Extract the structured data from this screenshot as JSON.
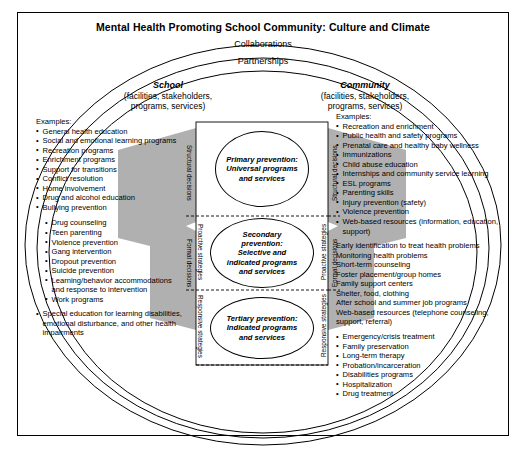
{
  "title": "Mental Health Promoting School Community: Culture and Climate",
  "outer_ring_label": "Collaborations",
  "inner_ring_label": "Partnerships",
  "columns": {
    "school": {
      "name": "School",
      "subtitle": "(facilities, stakeholders,\nprograms, services)",
      "examples_label": "Examples:",
      "primary_items": [
        "General health education",
        "Social and emotional learning programs",
        "Recreation programs",
        "Enrichment programs",
        "Support for transitions",
        "Conflict resolution",
        "Home involvement",
        "Drug and alcohol education",
        "Bullying prevention"
      ],
      "secondary_items": [
        "Drug counseling",
        "Teen parenting",
        "Violence prevention",
        "Gang intervention",
        "Dropout prevention",
        "Suicide prevention",
        "Learning/behavior accommodations and response to intervention",
        "Work programs"
      ],
      "tertiary_items": [
        "Special education for learning disabilities, emotional disturbance, and other health impairments"
      ]
    },
    "community": {
      "name": "Community",
      "subtitle": "(facilities, stakeholders,\nprograms, services)",
      "examples_label": "Examples:",
      "primary_items": [
        "Recreation and enrichment",
        "Public health and safety programs",
        "Prenatal care and healthy baby wellness",
        "Immunizations",
        "Child abuse education",
        "Internships and community service learning",
        "ESL programs",
        "Parenting skills",
        "Injury prevention (safety)",
        "Violence prevention",
        "Web-based resources (information, education, support)"
      ],
      "secondary_items": [
        "Early identification to treat health problems",
        "Monitoring health problems",
        "Short-term counseling",
        "Foster placement/group homes",
        "Family support centers",
        "Shelter, food, clothing",
        "After school and summer job programs",
        "Web-based resources (telephone counseling, support, referral)"
      ],
      "tertiary_items": [
        "Emergency/crisis treatment",
        "Family preservation",
        "Long-term therapy",
        "Probation/incarceration",
        "Disabilities programs",
        "Hospitalization",
        "Drug treatment"
      ]
    }
  },
  "center": {
    "levels": [
      {
        "text": "Primary prevention:\nUniversal programs\nand services"
      },
      {
        "text": "Secondary\nprevention:\nSelective and\nindicated programs\nand services"
      },
      {
        "text": "Tertiary prevention:\nIndicated programs\nand services"
      }
    ]
  },
  "vertical_labels": {
    "outer_left_top": "Structural decisions",
    "outer_left_mid": "Formal decisions",
    "outer_right_top": "Structural decisions",
    "outer_right_mid": "Formal decisions",
    "inner_left_top": "Proactive strategies",
    "inner_left_bottom": "Responsive strategies",
    "inner_right_top": "Proactive strategies",
    "inner_right_bottom": "Responsive strategies"
  },
  "colors": {
    "wedge_gray": "#a9a9a9",
    "line": "#000000",
    "background": "#ffffff"
  }
}
